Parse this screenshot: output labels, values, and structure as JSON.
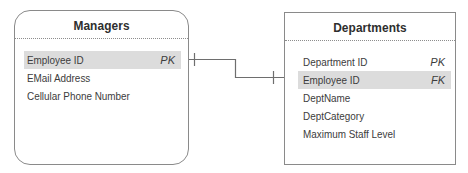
{
  "diagram": {
    "type": "entity-relationship",
    "entities": [
      {
        "name": "Managers",
        "attributes": [
          {
            "label": "Employee ID",
            "key": "PK",
            "highlighted": true
          },
          {
            "label": "EMail Address",
            "key": "",
            "highlighted": false
          },
          {
            "label": "Cellular Phone Number",
            "key": "",
            "highlighted": false
          }
        ]
      },
      {
        "name": "Departments",
        "attributes": [
          {
            "label": "Department ID",
            "key": "PK",
            "highlighted": false
          },
          {
            "label": "Employee ID",
            "key": "FK",
            "highlighted": true
          },
          {
            "label": "DeptName",
            "key": "",
            "highlighted": false
          },
          {
            "label": "DeptCategory",
            "key": "",
            "highlighted": false
          },
          {
            "label": "Maximum Staff Level",
            "key": "",
            "highlighted": false
          }
        ]
      }
    ],
    "relationship": {
      "from": "Managers.Employee ID",
      "to": "Departments.Employee ID",
      "from_cardinality": "one",
      "to_cardinality": "one",
      "line_color": "#6e6e6e"
    }
  }
}
